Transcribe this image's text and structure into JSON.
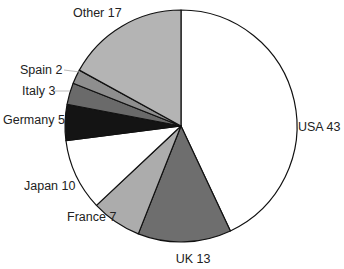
{
  "chart_data": {
    "type": "pie",
    "title": "",
    "start_angle_deg": 0,
    "direction": "clockwise",
    "center": [
      181,
      126
    ],
    "radius": 116,
    "slices": [
      {
        "label": "USA",
        "value": 43,
        "color": "#ffffff",
        "text": "USA 43",
        "lx": 298,
        "ly": 131,
        "anchor": "start"
      },
      {
        "label": "UK",
        "value": 13,
        "color": "#6e6e6e",
        "text": "UK 13",
        "lx": 193,
        "ly": 263,
        "anchor": "middle"
      },
      {
        "label": "France",
        "value": 7,
        "color": "#acacac",
        "text": "France 7",
        "lx": 67,
        "ly": 221,
        "anchor": "start"
      },
      {
        "label": "Japan",
        "value": 10,
        "color": "#ffffff",
        "text": "Japan 10",
        "lx": 24,
        "ly": 190,
        "anchor": "start"
      },
      {
        "label": "Germany",
        "value": 5,
        "color": "#141414",
        "text": "Germany 5",
        "lx": 3,
        "ly": 124,
        "anchor": "start"
      },
      {
        "label": "Italy",
        "value": 3,
        "color": "#6a6a6a",
        "text": "Italy 3",
        "lx": 22,
        "ly": 95,
        "anchor": "start",
        "leader": [
          [
            55,
            91
          ],
          [
            70,
            91
          ]
        ]
      },
      {
        "label": "Spain",
        "value": 2,
        "color": "#8e8e8e",
        "text": "Spain 2",
        "lx": 20,
        "ly": 74,
        "anchor": "start",
        "leader": [
          [
            64,
            70
          ],
          [
            80,
            72
          ]
        ]
      },
      {
        "label": "Other",
        "value": 17,
        "color": "#b4b4b4",
        "text": "Other 17",
        "lx": 73,
        "ly": 17,
        "anchor": "start"
      }
    ],
    "legend": "none"
  }
}
